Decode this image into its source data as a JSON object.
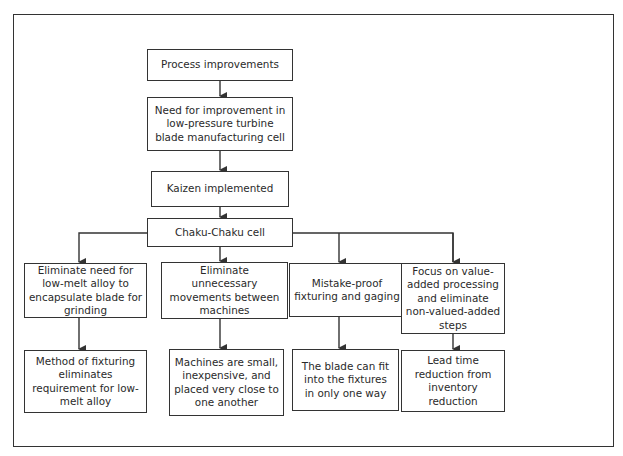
{
  "diagram": {
    "type": "flowchart",
    "colors": {
      "line": "#333333",
      "text": "#2a2a2a",
      "background": "#ffffff"
    },
    "main_chain": [
      {
        "id": "process-improvements",
        "label": "Process improvements"
      },
      {
        "id": "need-for-improvement",
        "label": "Need for improvement in low-pressure turbine blade manufacturing cell"
      },
      {
        "id": "kaizen-implemented",
        "label": "Kaizen implemented"
      },
      {
        "id": "chaku-chaku-cell",
        "label": "Chaku-Chaku cell"
      }
    ],
    "branches": [
      {
        "action": "Eliminate need for low-melt alloy to encapsulate blade for grinding",
        "result": "Method of fixturing eliminates requirement for low-melt alloy"
      },
      {
        "action": "Eliminate unnecessary movements between machines",
        "result": "Machines are small, inexpensive, and placed very close to one another"
      },
      {
        "action": "Mistake-proof fixturing and gaging",
        "result": "The blade can fit into the fixtures in only one way"
      },
      {
        "action": "Focus on value-added processing and eliminate non-valued-added steps",
        "result": "Lead time reduction from inventory reduction"
      }
    ],
    "edges": [
      [
        "process-improvements",
        "need-for-improvement"
      ],
      [
        "need-for-improvement",
        "kaizen-implemented"
      ],
      [
        "kaizen-implemented",
        "chaku-chaku-cell"
      ],
      [
        "chaku-chaku-cell",
        "branch-0-action"
      ],
      [
        "chaku-chaku-cell",
        "branch-1-action"
      ],
      [
        "chaku-chaku-cell",
        "branch-2-action"
      ],
      [
        "chaku-chaku-cell",
        "branch-3-action"
      ],
      [
        "branch-0-action",
        "branch-0-result"
      ],
      [
        "branch-1-action",
        "branch-1-result"
      ],
      [
        "branch-2-action",
        "branch-2-result"
      ],
      [
        "branch-3-action",
        "branch-3-result"
      ]
    ]
  }
}
